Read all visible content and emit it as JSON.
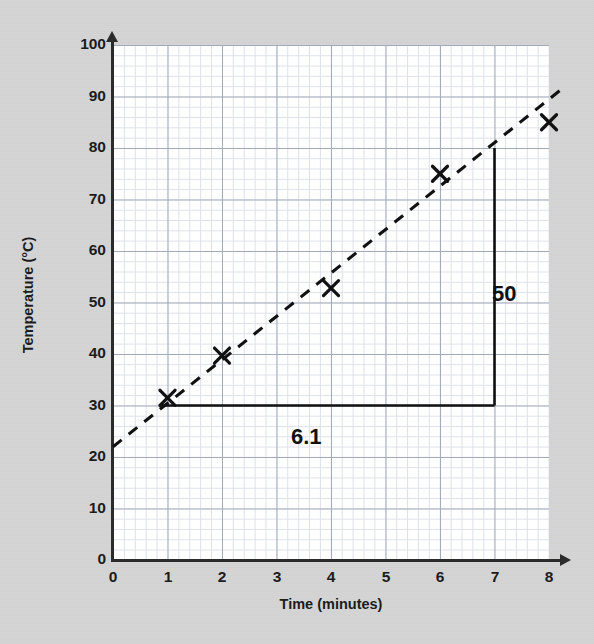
{
  "figure": {
    "background_color": "#d4d4d4",
    "plot_background_color": "#ffffff",
    "grid_minor_color": "#c9cfdd",
    "grid_major_color": "#8e97ab",
    "axis_color": "#2b2b2b",
    "ink_color": "#111111"
  },
  "chart_data": {
    "type": "scatter",
    "title": "",
    "xlabel": "Time (minutes)",
    "ylabel": "Temperature (°C)",
    "xlim": [
      0,
      8.3
    ],
    "ylim": [
      0,
      100
    ],
    "grid": true,
    "legend": "none",
    "x_ticks": [
      "0",
      "1",
      "2",
      "3",
      "4",
      "5",
      "6",
      "7",
      "8"
    ],
    "x_tick_values": [
      0,
      1,
      2,
      3,
      4,
      5,
      6,
      7,
      8
    ],
    "y_ticks": [
      "0",
      "10",
      "20",
      "30",
      "40",
      "50",
      "60",
      "70",
      "80",
      "90",
      "100"
    ],
    "y_tick_values": [
      0,
      10,
      20,
      30,
      40,
      50,
      60,
      70,
      80,
      90,
      100
    ],
    "x_minor_step": 0.2,
    "y_minor_step": 2,
    "series": [
      {
        "name": "Measured temperature",
        "marker": "x",
        "x": [
          1,
          2,
          4,
          6,
          8
        ],
        "y": [
          31.5,
          39.7,
          52.8,
          75,
          85
        ]
      },
      {
        "name": "Line of best fit",
        "style": "dashed",
        "x": [
          0,
          8.3
        ],
        "y": [
          22,
          92
        ]
      }
    ],
    "annotations": [
      {
        "name": "gradient-triangle",
        "style": "solid",
        "description": "Right-angled triangle drawn under the line of best fit to read the gradient",
        "corner_x": 7,
        "corner_y": 30,
        "horizontal_from_x": 0.9,
        "horizontal_to_x": 7,
        "horizontal_y": 30,
        "vertical_x": 7,
        "vertical_from_y": 30,
        "vertical_to_y": 80
      },
      {
        "name": "rise-label",
        "text": "50",
        "x": 7.2,
        "y": 55
      },
      {
        "name": "run-label",
        "text": "6.1",
        "x": 4,
        "y": 26
      }
    ]
  },
  "axes": {
    "y_title": "Temperature (°C)",
    "x_title": "Time (minutes)",
    "y_tick_labels": [
      "100",
      "90",
      "80",
      "70",
      "60",
      "50",
      "40",
      "30",
      "20",
      "10",
      "0"
    ],
    "x_tick_labels": [
      "0",
      "1",
      "2",
      "3",
      "4",
      "5",
      "6",
      "7",
      "8"
    ]
  },
  "annotations": {
    "rise": "50",
    "run": "6.1"
  }
}
